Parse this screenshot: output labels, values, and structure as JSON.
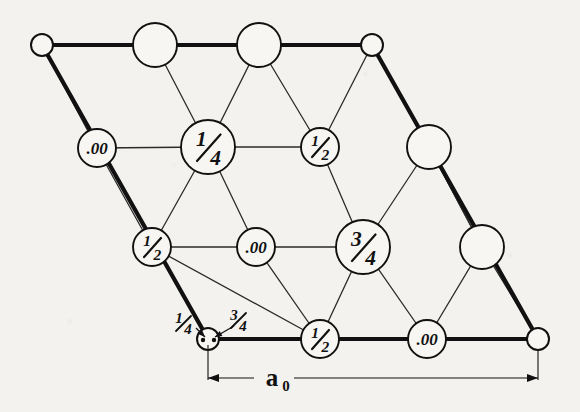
{
  "figure": {
    "kind": "crystal-structure-projection",
    "caption_symbol": "a₀",
    "colors": {
      "ink": "#111111",
      "paper": "#f3f2ee",
      "thin_line": "#2b2b2b"
    },
    "cell": {
      "corners": [
        {
          "name": "top-left",
          "x": 42,
          "y": 45,
          "r": 11
        },
        {
          "name": "top-right",
          "x": 372,
          "y": 45,
          "r": 11
        },
        {
          "name": "bottom-left",
          "x": 208,
          "y": 339,
          "r": 11
        },
        {
          "name": "bottom-right",
          "x": 538,
          "y": 339,
          "r": 11
        }
      ]
    },
    "bonds_thin": [
      [
        155,
        45,
        208,
        147
      ],
      [
        259,
        45,
        208,
        147
      ],
      [
        259,
        45,
        320,
        147
      ],
      [
        372,
        45,
        429,
        147
      ],
      [
        97,
        148,
        208,
        147
      ],
      [
        208,
        147,
        320,
        147
      ],
      [
        320,
        147,
        363,
        247
      ],
      [
        429,
        147,
        363,
        247
      ],
      [
        42,
        45,
        97,
        148
      ],
      [
        97,
        148,
        152,
        247
      ],
      [
        208,
        147,
        256,
        247
      ],
      [
        256,
        247,
        363,
        247
      ],
      [
        152,
        247,
        256,
        247
      ],
      [
        152,
        247,
        208,
        147
      ],
      [
        363,
        247,
        320,
        339
      ],
      [
        363,
        247,
        427,
        339
      ],
      [
        427,
        339,
        482,
        247
      ],
      [
        482,
        247,
        429,
        147
      ],
      [
        320,
        339,
        256,
        247
      ],
      [
        152,
        247,
        320,
        339
      ],
      [
        320,
        147,
        372,
        45
      ],
      [
        482,
        247,
        538,
        339
      ],
      [
        429,
        147,
        482,
        247
      ]
    ],
    "edges_thick": [
      [
        42,
        45,
        372,
        45
      ],
      [
        42,
        45,
        208,
        339
      ],
      [
        208,
        339,
        538,
        339
      ],
      [
        372,
        45,
        538,
        339
      ]
    ],
    "atoms": [
      {
        "id": "a1",
        "label": "",
        "x": 42,
        "y": 45,
        "r": 11,
        "size": "small",
        "name": "corner-atom-top-left"
      },
      {
        "id": "a2",
        "label": "",
        "x": 155,
        "y": 45,
        "r": 22,
        "size": "large",
        "name": "top-edge-atom-1"
      },
      {
        "id": "a3",
        "label": "",
        "x": 259,
        "y": 45,
        "r": 22,
        "size": "large",
        "name": "top-edge-atom-2"
      },
      {
        "id": "a4",
        "label": "",
        "x": 372,
        "y": 45,
        "r": 11,
        "size": "small",
        "name": "corner-atom-top-right"
      },
      {
        "id": "a5",
        "label": ".00",
        "x": 97,
        "y": 148,
        "r": 19,
        "size": "medium",
        "name": "atom-zero-left"
      },
      {
        "id": "a6",
        "label": "1/4",
        "x": 208,
        "y": 147,
        "r": 27,
        "size": "xlarge",
        "name": "atom-quarter-center"
      },
      {
        "id": "a7",
        "label": "1/2",
        "x": 320,
        "y": 147,
        "r": 19,
        "size": "medium",
        "name": "atom-half-upper-right"
      },
      {
        "id": "a8",
        "label": "",
        "x": 429,
        "y": 147,
        "r": 22,
        "size": "large",
        "name": "right-atom-upper"
      },
      {
        "id": "a9",
        "label": "1/2",
        "x": 152,
        "y": 247,
        "r": 19,
        "size": "medium",
        "name": "atom-half-left"
      },
      {
        "id": "a10",
        "label": ".00",
        "x": 256,
        "y": 247,
        "r": 19,
        "size": "medium",
        "name": "atom-zero-center"
      },
      {
        "id": "a11",
        "label": "3/4",
        "x": 363,
        "y": 247,
        "r": 27,
        "size": "xlarge",
        "name": "atom-three-quarter-center"
      },
      {
        "id": "a12",
        "label": "",
        "x": 482,
        "y": 247,
        "r": 22,
        "size": "large",
        "name": "right-atom-lower"
      },
      {
        "id": "a13",
        "label": "",
        "x": 208,
        "y": 339,
        "r": 11,
        "size": "small",
        "name": "corner-atom-bottom-left"
      },
      {
        "id": "a14",
        "label": "1/2",
        "x": 320,
        "y": 339,
        "r": 19,
        "size": "medium",
        "name": "atom-half-bottom"
      },
      {
        "id": "a15",
        "label": ".00",
        "x": 427,
        "y": 339,
        "r": 19,
        "size": "medium",
        "name": "atom-zero-bottom"
      },
      {
        "id": "a16",
        "label": "",
        "x": 538,
        "y": 339,
        "r": 11,
        "size": "small",
        "name": "corner-atom-bottom-right"
      }
    ],
    "corner_callouts": [
      {
        "label": "1/4",
        "text_x": 183,
        "text_y": 323,
        "arrow_from": [
          196,
          328
        ],
        "arrow_to": [
          205,
          337
        ],
        "name": "callout-quarter"
      },
      {
        "label": "3/4",
        "text_x": 238,
        "text_y": 320,
        "arrow_from": [
          234,
          326
        ],
        "arrow_to": [
          215,
          337
        ],
        "name": "callout-three-quarter"
      }
    ],
    "inner_dots": [
      {
        "x": 203,
        "y": 340,
        "r": 2.2
      },
      {
        "x": 214,
        "y": 340,
        "r": 2.2
      }
    ],
    "dimension": {
      "label": "a₀",
      "label_x": 372,
      "label_y": 386,
      "line_y": 378,
      "x_start": 208,
      "x_end": 538,
      "tick_left_top": 345,
      "tick_right_top": 349
    }
  }
}
